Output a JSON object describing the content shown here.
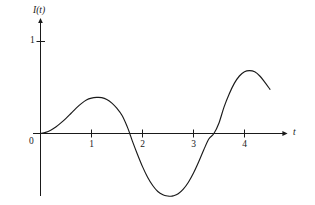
{
  "figure": {
    "background_color": "#ffffff",
    "curve_color": "#1a1a1a",
    "axis_color": "#1a1a1a",
    "text_color": "#1a1a1a"
  },
  "axes": {
    "y_axis_label": "I(t)",
    "x_axis_label": "t",
    "origin_label": "0",
    "x_tick_labels": [
      "1",
      "2",
      "3",
      "4"
    ],
    "y_tick_labels": [
      "1"
    ]
  },
  "chart_data": {
    "type": "line",
    "title": "",
    "xlabel": "t",
    "ylabel": "I(t)",
    "xlim": [
      -0.15,
      4.8
    ],
    "ylim": [
      -0.78,
      1.22
    ],
    "grid": false,
    "legend": null,
    "x_ticks": [
      1,
      2,
      3,
      4
    ],
    "y_ticks": [
      1
    ],
    "origin_label": "0",
    "series": [
      {
        "name": "I(t)",
        "color": "#1a1a1a",
        "x": [
          0.0,
          0.1,
          0.2,
          0.3,
          0.4,
          0.5,
          0.6,
          0.7,
          0.8,
          0.9,
          1.0,
          1.1,
          1.2,
          1.3,
          1.4,
          1.5,
          1.6,
          1.7,
          1.75,
          1.8,
          1.9,
          2.0,
          2.1,
          2.2,
          2.3,
          2.4,
          2.5,
          2.55,
          2.6,
          2.7,
          2.8,
          2.9,
          3.0,
          3.1,
          3.2,
          3.3,
          3.4,
          3.5,
          3.6,
          3.7,
          3.8,
          3.9,
          4.0,
          4.1,
          4.2,
          4.3,
          4.4,
          4.5
        ],
        "y": [
          0.0,
          0.012,
          0.035,
          0.07,
          0.115,
          0.165,
          0.22,
          0.275,
          0.325,
          0.365,
          0.385,
          0.392,
          0.39,
          0.37,
          0.33,
          0.272,
          0.195,
          0.075,
          0.0,
          -0.08,
          -0.225,
          -0.36,
          -0.475,
          -0.565,
          -0.63,
          -0.665,
          -0.68,
          -0.682,
          -0.678,
          -0.655,
          -0.605,
          -0.53,
          -0.43,
          -0.31,
          -0.18,
          -0.06,
          0.0,
          0.115,
          0.29,
          0.43,
          0.545,
          0.625,
          0.672,
          0.684,
          0.67,
          0.625,
          0.555,
          0.48
        ],
        "key_points": [
          {
            "label": "origin",
            "x": 0.0,
            "y": 0.0
          },
          {
            "label": "first-peak",
            "x": 1.15,
            "y": 0.39
          },
          {
            "label": "first-zero-crossing",
            "x": 1.75,
            "y": 0.0
          },
          {
            "label": "trough",
            "x": 2.55,
            "y": -0.68
          },
          {
            "label": "second-zero-crossing",
            "x": 3.4,
            "y": 0.0
          },
          {
            "label": "second-peak",
            "x": 4.1,
            "y": 0.68
          },
          {
            "label": "curve-end",
            "x": 4.5,
            "y": 0.48
          }
        ]
      }
    ]
  }
}
